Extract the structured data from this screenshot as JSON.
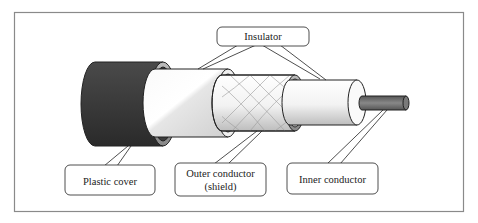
{
  "diagram": {
    "labels": {
      "insulator": "Insulator",
      "plastic_cover": "Plastic cover",
      "outer_conductor_line1": "Outer conductor",
      "outer_conductor_line2": "(shield)",
      "inner_conductor": "Inner conductor"
    },
    "layers": [
      {
        "name": "Plastic cover",
        "color": "#3a3a3a"
      },
      {
        "name": "Insulator",
        "color": "#f2f2f2"
      },
      {
        "name": "Outer conductor (shield)",
        "color": "#eeeeee"
      },
      {
        "name": "Insulator",
        "color": "#f4f4f4"
      },
      {
        "name": "Inner conductor",
        "color": "#707070"
      }
    ],
    "colors": {
      "frame": "#8a8a8a",
      "stroke": "#222222",
      "background": "#ffffff"
    }
  }
}
